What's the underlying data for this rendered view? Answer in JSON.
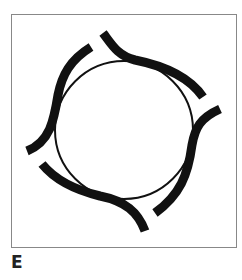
{
  "figure": {
    "label": "E",
    "border_color": "#888888",
    "stroke_color": "#111111",
    "circle": {
      "cx": 124,
      "cy": 130,
      "r": 69
    },
    "arcs": [
      {
        "name": "arc-top-right",
        "d": "M103,33 C112,45 118,56 135,60 C165,66 190,78 203,97"
      },
      {
        "name": "arc-right",
        "d": "M220,109 C200,118 195,128 192,145 C188,175 180,195 155,213"
      },
      {
        "name": "arc-bottom",
        "d": "M42,164 C55,180 75,190 100,196 C125,201 138,212 145,231"
      },
      {
        "name": "arc-left",
        "d": "M91,47 C70,60 62,75 58,95 C54,120 50,142 27,151"
      }
    ]
  }
}
